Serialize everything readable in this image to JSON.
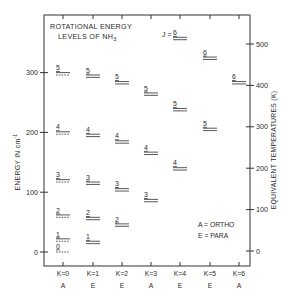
{
  "diagram": {
    "title_line1": "ROTATIONAL ENERGY",
    "title_line2": "LEVELS OF NH",
    "title_subscript": "3",
    "j_prefix": "J = ",
    "left_axis": {
      "label": "ENERGY IN cm",
      "label_superscript": "-1",
      "ticks": [
        0,
        100,
        200,
        300
      ]
    },
    "right_axis": {
      "label": "EQUIVALENT TEMPERATURES (K)",
      "ticks": [
        0,
        100,
        200,
        300,
        400,
        500
      ]
    },
    "legend": {
      "line1": "A = ORTHO",
      "line2": "E = PARA"
    },
    "columns": [
      {
        "k_label": "K = 0",
        "symmetry": "A"
      },
      {
        "k_label": "K = 1",
        "symmetry": "E"
      },
      {
        "k_label": "K = 2",
        "symmetry": "E"
      },
      {
        "k_label": "K = 3",
        "symmetry": "A"
      },
      {
        "k_label": "K = 4",
        "symmetry": "E"
      },
      {
        "k_label": "K = 5",
        "symmetry": "E"
      },
      {
        "k_label": "K = 6",
        "symmetry": "A"
      }
    ]
  },
  "chart_data": {
    "type": "energy-level-diagram",
    "title": "Rotational Energy Levels of NH3",
    "ylabel": "Energy in cm^-1",
    "ylabel_right": "Equivalent Temperatures (K)",
    "ylim": [
      -5,
      320
    ],
    "ylim_right": [
      -5,
      560
    ],
    "categories": [
      "K=0 (A)",
      "K=1 (E)",
      "K=2 (E)",
      "K=3 (A)",
      "K=4 (E)",
      "K=5 (E)",
      "K=6 (A)"
    ],
    "series": [
      {
        "name": "K=0",
        "levels": [
          {
            "J": 0,
            "E": 0,
            "style": "dashed"
          },
          {
            "J": 1,
            "E": 20,
            "style": "solid-dashed"
          },
          {
            "J": 2,
            "E": 60,
            "style": "solid-dashed"
          },
          {
            "J": 3,
            "E": 119,
            "style": "solid-dashed"
          },
          {
            "J": 4,
            "E": 199,
            "style": "solid-dashed"
          },
          {
            "J": 5,
            "E": 298,
            "style": "solid-dashed"
          }
        ]
      },
      {
        "name": "K=1",
        "levels": [
          {
            "J": 1,
            "E": 16
          },
          {
            "J": 2,
            "E": 56
          },
          {
            "J": 3,
            "E": 115
          },
          {
            "J": 4,
            "E": 195
          },
          {
            "J": 5,
            "E": 294
          }
        ]
      },
      {
        "name": "K=2",
        "levels": [
          {
            "J": 2,
            "E": 45
          },
          {
            "J": 3,
            "E": 104
          },
          {
            "J": 4,
            "E": 184
          },
          {
            "J": 5,
            "E": 283
          }
        ]
      },
      {
        "name": "K=3",
        "levels": [
          {
            "J": 3,
            "E": 86
          },
          {
            "J": 4,
            "E": 165
          },
          {
            "J": 5,
            "E": 264
          }
        ]
      },
      {
        "name": "K=4",
        "levels": [
          {
            "J": 4,
            "E": 139
          },
          {
            "J": 5,
            "E": 238
          },
          {
            "J": 6,
            "E": 357
          }
        ]
      },
      {
        "name": "K=5",
        "levels": [
          {
            "J": 5,
            "E": 205
          },
          {
            "J": 6,
            "E": 324
          }
        ]
      },
      {
        "name": "K=6",
        "levels": [
          {
            "J": 6,
            "E": 283
          }
        ]
      }
    ],
    "legend": [
      "A = ORTHO",
      "E = PARA"
    ],
    "grid": false
  }
}
